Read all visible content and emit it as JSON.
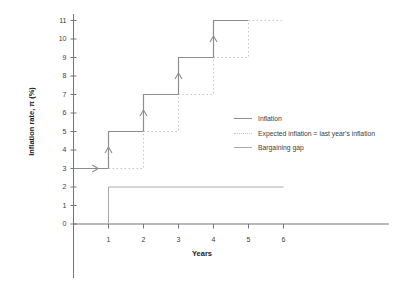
{
  "chart_data": {
    "type": "line",
    "title": "",
    "xlabel": "Years",
    "ylabel": "Inflation rate, π (%)",
    "x_ticks": [
      1,
      2,
      3,
      4,
      5,
      6
    ],
    "y_ticks": [
      0,
      1,
      2,
      3,
      4,
      5,
      6,
      7,
      8,
      9,
      10,
      11
    ],
    "xlim": [
      0,
      9
    ],
    "ylim": [
      0,
      11.4
    ],
    "grid": false,
    "legend": {
      "position": "center-right",
      "entries": [
        "Inflation",
        "Expected inflation = last year's inflation",
        "Bargaining gap"
      ]
    },
    "series": [
      {
        "name": "Inflation",
        "type": "step",
        "line_style": "solid",
        "color": "#8d8d8d",
        "points": [
          [
            0,
            3
          ],
          [
            1,
            3
          ],
          [
            1,
            5
          ],
          [
            2,
            5
          ],
          [
            2,
            7
          ],
          [
            3,
            7
          ],
          [
            3,
            9
          ],
          [
            4,
            9
          ],
          [
            4,
            11
          ],
          [
            5,
            11
          ]
        ]
      },
      {
        "name": "Expected inflation = last year's inflation",
        "type": "step",
        "line_style": "dotted",
        "color": "#c9c9c9",
        "points": [
          [
            1,
            3
          ],
          [
            2,
            3
          ],
          [
            2,
            5
          ],
          [
            3,
            5
          ],
          [
            3,
            7
          ],
          [
            4,
            7
          ],
          [
            4,
            9
          ],
          [
            5,
            9
          ],
          [
            5,
            11
          ],
          [
            6,
            11
          ]
        ]
      },
      {
        "name": "Bargaining gap",
        "type": "step",
        "line_style": "solid",
        "color": "#aaaaaa",
        "points": [
          [
            1,
            0
          ],
          [
            1,
            2
          ],
          [
            6,
            2
          ]
        ]
      }
    ],
    "annotations": {
      "arrow_color": "#8d8d8d",
      "arrows": [
        {
          "x": 0.62,
          "y": 3,
          "dir": "right"
        },
        {
          "x": 1,
          "y": 4,
          "dir": "up"
        },
        {
          "x": 2,
          "y": 6,
          "dir": "up"
        },
        {
          "x": 3,
          "y": 8,
          "dir": "up"
        },
        {
          "x": 4,
          "y": 10,
          "dir": "up"
        }
      ]
    },
    "axis_color": "#757575",
    "tick_label_color": "#3d3d3d",
    "axis_title_color": "#222222"
  }
}
